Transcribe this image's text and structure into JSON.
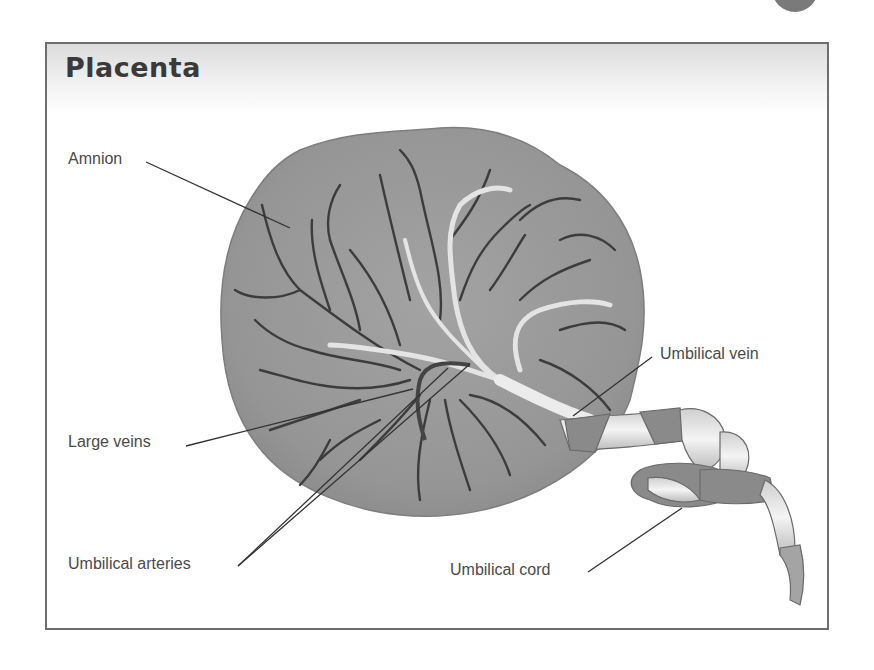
{
  "diagram": {
    "title": "Placenta",
    "labels": [
      {
        "id": "amnion",
        "text": "Amnion"
      },
      {
        "id": "large-veins",
        "text": "Large veins"
      },
      {
        "id": "umbilical-arteries",
        "text": "Umbilical arteries"
      },
      {
        "id": "umbilical-vein",
        "text": "Umbilical vein"
      },
      {
        "id": "umbilical-cord",
        "text": "Umbilical cord"
      }
    ],
    "colors": {
      "frame_border": "#6e6e6e",
      "title": "#3a3a3a",
      "label_text": "#4a4a4a",
      "placenta_fill": "#9a9a9a",
      "vessel_dark": "#3c3c3c",
      "vessel_light": "#e4e4e4",
      "cord_band": "#8a8a8a"
    }
  }
}
